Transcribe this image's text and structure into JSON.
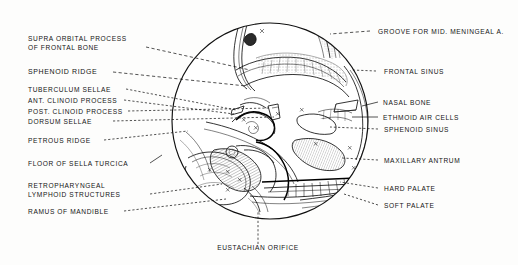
{
  "figure": {
    "type": "anatomical-illustration",
    "shape": "circular-field",
    "circle": {
      "cx": 270,
      "cy": 121,
      "r": 99
    },
    "ink_color": "#111111",
    "background_color": "#fdfdfc"
  },
  "labels": {
    "left": [
      {
        "id": "supraorbital-process",
        "line1": "SUPRA ORBITAL  PROCESS",
        "line2": "OF  FRONTAL  BONE"
      },
      {
        "id": "sphenoid-ridge",
        "line1": "SPHENOID  RIDGE"
      },
      {
        "id": "tuberculum-sellae",
        "line1": "TUBERCULUM  SELLAE"
      },
      {
        "id": "ant-clinoid-process",
        "line1": "ANT. CLINOID PROCESS"
      },
      {
        "id": "post-clinoid-process",
        "line1": "POST. CLINOID PROCESS"
      },
      {
        "id": "dorsum-sellae",
        "line1": "DORSUM  SELLAE"
      },
      {
        "id": "petrous-ridge",
        "line1": "PETROUS  RIDGE"
      },
      {
        "id": "floor-of-sella-turcica",
        "line1": "FLOOR OF SELLA  TURCICA"
      },
      {
        "id": "retropharyngeal-lymphoid",
        "line1": "RETROPHARYNGEAL",
        "line2": "LYMPHOID  STRUCTURES"
      },
      {
        "id": "ramus-of-mandible",
        "line1": "RAMUS OF MANDIBLE"
      }
    ],
    "right": [
      {
        "id": "groove-mid-meningeal",
        "line1": "GROOVE  FOR  MID. MENINGEAL  A."
      },
      {
        "id": "frontal-sinus",
        "line1": "FRONTAL  SINUS"
      },
      {
        "id": "nasal-bone",
        "line1": "NASAL  BONE"
      },
      {
        "id": "ethmoid-air-cells",
        "line1": "ETHMOID  AIR CELLS"
      },
      {
        "id": "sphenoid-sinus",
        "line1": "SPHENOID  SINUS"
      },
      {
        "id": "maxillary-antrum",
        "line1": "MAXILLARY  ANTRUM"
      },
      {
        "id": "hard-palate",
        "line1": "HARD PALATE"
      },
      {
        "id": "soft-palate",
        "line1": "SOFT  PALATE"
      }
    ],
    "bottom": [
      {
        "id": "eustachian-orifice",
        "line1": "EUSTACHIAN  ORIFICE"
      }
    ]
  }
}
